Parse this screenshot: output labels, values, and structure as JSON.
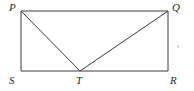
{
  "figure": {
    "kind": "geometry-diagram",
    "background_color": "#ffffff",
    "stroke_color": "#3a3a3a",
    "stroke_width": 1,
    "label_color": "#2b2b2b",
    "canvas": {
      "width": 194,
      "height": 91
    },
    "vertices": [
      {
        "name": "P",
        "label": "P",
        "x": 21,
        "y": 11,
        "label_x": 9,
        "label_y": 2
      },
      {
        "name": "Q",
        "label": "Q",
        "x": 168,
        "y": 11,
        "label_x": 172,
        "label_y": 2
      },
      {
        "name": "R",
        "label": "R",
        "x": 168,
        "y": 71,
        "label_x": 170,
        "label_y": 75
      },
      {
        "name": "T",
        "label": "T",
        "x": 80,
        "y": 71,
        "label_x": 76,
        "label_y": 75
      },
      {
        "name": "S",
        "label": "S",
        "x": 21,
        "y": 71,
        "label_x": 9,
        "label_y": 75
      }
    ],
    "rectangle": {
      "left": 21,
      "top": 11,
      "right": 168,
      "bottom": 71,
      "points": "21,11 168,11 168,71 21,71"
    },
    "segments": [
      {
        "name": "PQ",
        "from": "P",
        "to": "Q",
        "x1": 21,
        "y1": 11,
        "x2": 168,
        "y2": 11
      },
      {
        "name": "QR",
        "from": "Q",
        "to": "R",
        "x1": 168,
        "y1": 11,
        "x2": 168,
        "y2": 71
      },
      {
        "name": "RS",
        "from": "R",
        "to": "S",
        "x1": 168,
        "y1": 71,
        "x2": 21,
        "y2": 71
      },
      {
        "name": "SP",
        "from": "S",
        "to": "P",
        "x1": 21,
        "y1": 71,
        "x2": 21,
        "y2": 11
      },
      {
        "name": "PT",
        "from": "P",
        "to": "T",
        "x1": 21,
        "y1": 11,
        "x2": 80,
        "y2": 71
      },
      {
        "name": "TQ",
        "from": "T",
        "to": "Q",
        "x1": 80,
        "y1": 71,
        "x2": 168,
        "y2": 11
      }
    ]
  }
}
